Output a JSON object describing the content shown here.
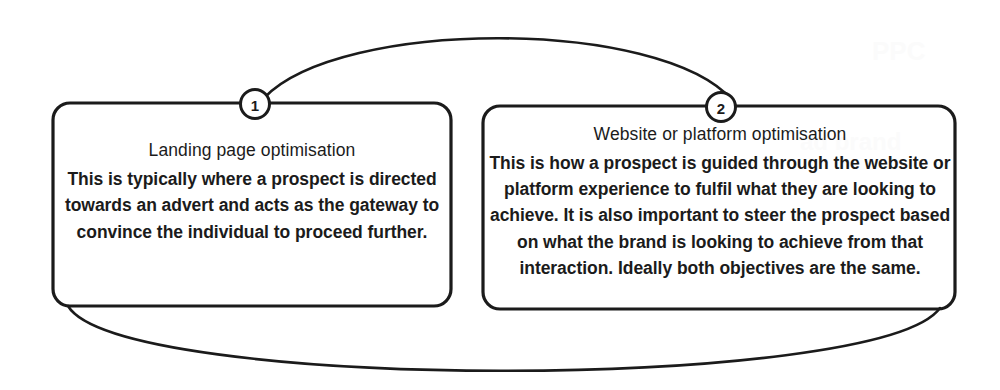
{
  "diagram": {
    "type": "two-node-cycle",
    "background_color": "#ffffff",
    "stroke_color": "#1b1b1b",
    "nodes": [
      {
        "badge": "1",
        "title": "Landing page optimisation",
        "body": "This is typically where a prospect is directed towards an advert and acts as the gateway to convince the individual to proceed further."
      },
      {
        "badge": "2",
        "title": "Website or platform optimisation",
        "body": "This is how a prospect is guided through the website or platform experience to fulfil what they are looking to achieve. It is also important to steer the prospect based on what the brand is looking to achieve from that interaction. Ideally both objectives are the same."
      }
    ],
    "connectors": [
      {
        "name": "top-arc",
        "from": "1",
        "to": "2"
      },
      {
        "name": "bottom-arc",
        "from": "1",
        "to": "2"
      }
    ]
  },
  "artifacts": {
    "bleed_1": "PPC",
    "bleed_2": "ad brand"
  }
}
